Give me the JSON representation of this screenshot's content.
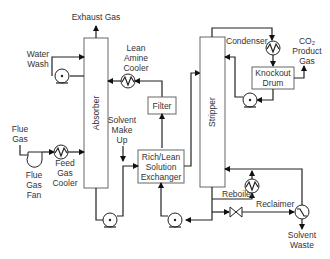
{
  "diagram": {
    "units": {
      "absorber": "Absorber",
      "stripper": "Stripper",
      "filter": "Filter",
      "exchanger": [
        "Rich/Lean",
        "Solution",
        "Exchanger"
      ],
      "knockout": [
        "Knockout",
        "Drum"
      ]
    },
    "labels": {
      "exhaust_gas": "Exhaust Gas",
      "water_wash": [
        "Water",
        "Wash"
      ],
      "lean_amine_cooler": [
        "Lean",
        "Amine",
        "Cooler"
      ],
      "solvent_makeup": [
        "Solvent",
        "Make",
        "Up"
      ],
      "flue_gas": [
        "Flue",
        "Gas"
      ],
      "flue_gas_fan": [
        "Flue",
        "Gas",
        "Fan"
      ],
      "feed_gas_cooler": [
        "Feed",
        "Gas",
        "Cooler"
      ],
      "condenser": "Condenser",
      "co2_product": [
        "CO₂",
        "Product",
        "Gas"
      ],
      "reboiler": "Reboiler",
      "reclaimer": "Reclaimer",
      "solvent_waste": [
        "Solvent",
        "Waste"
      ]
    }
  }
}
